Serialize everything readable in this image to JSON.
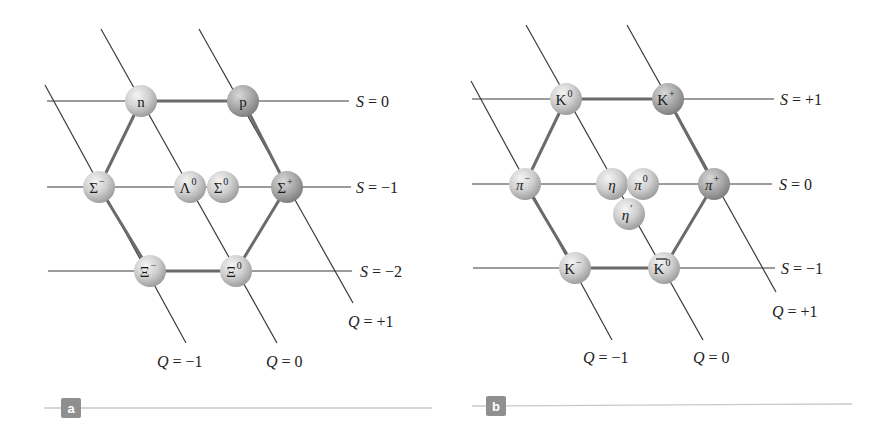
{
  "figure": {
    "colors": {
      "line": "#3a3a3a",
      "hex_edge": "#6b6b6b",
      "ball_light": "#f2f2f2",
      "ball_dark": "#9a9a9a",
      "ball_dark_charged": "#8a8a8a",
      "caption_line": "#c9c9c9",
      "badge": "#8f8f8f"
    },
    "panels": [
      {
        "id": "a",
        "badge": "a",
        "title": "Baryon octet",
        "badge_pos": [
          71,
          408
        ],
        "caption_line": [
          44,
          408,
          432,
          408
        ],
        "s_lines": [
          {
            "label_var": "S",
            "label_val": "= 0",
            "y": 101,
            "x1": 47,
            "x2": 349,
            "label_x": 356
          },
          {
            "label_var": "S",
            "label_val": "= −1",
            "y": 187,
            "x1": 47,
            "x2": 351,
            "label_x": 356
          },
          {
            "label_var": "S",
            "label_val": "= −2",
            "y": 271,
            "x1": 48,
            "x2": 352,
            "label_x": 360
          }
        ],
        "q_lines": [
          {
            "label_var": "Q",
            "label_val": "= −1",
            "x1": 45,
            "y1": 85,
            "x2": 186,
            "y2": 343,
            "label_x": 157,
            "label_y": 367
          },
          {
            "label_var": "Q",
            "label_val": "= 0",
            "x1": 101,
            "y1": 29,
            "x2": 277,
            "y2": 343,
            "label_x": 266,
            "label_y": 367
          },
          {
            "label_var": "Q",
            "label_val": "= +1",
            "x1": 199,
            "y1": 29,
            "x2": 353,
            "y2": 303,
            "label_x": 348,
            "label_y": 327
          }
        ],
        "hexagon": [
          [
            141,
            101
          ],
          [
            243,
            101
          ],
          [
            287,
            187
          ],
          [
            236,
            271
          ],
          [
            150,
            271
          ],
          [
            99,
            187
          ]
        ],
        "particles": [
          {
            "name": "neutron",
            "symbol": "n",
            "sup": "",
            "x": 141,
            "y": 101,
            "charged": false
          },
          {
            "name": "proton",
            "symbol": "p",
            "sup": "",
            "x": 243,
            "y": 101,
            "charged": true
          },
          {
            "name": "sigma-minus",
            "symbol": "Σ",
            "sup": "−",
            "x": 99,
            "y": 187,
            "charged": false
          },
          {
            "name": "lambda-zero",
            "symbol": "Λ",
            "sup": "0",
            "x": 190,
            "y": 187,
            "charged": false
          },
          {
            "name": "sigma-zero",
            "symbol": "Σ",
            "sup": "0",
            "x": 223,
            "y": 187,
            "charged": false
          },
          {
            "name": "sigma-plus",
            "symbol": "Σ",
            "sup": "+",
            "x": 287,
            "y": 187,
            "charged": true
          },
          {
            "name": "xi-minus",
            "symbol": "Ξ",
            "sup": "−",
            "x": 150,
            "y": 271,
            "charged": false
          },
          {
            "name": "xi-zero",
            "symbol": "Ξ",
            "sup": "0",
            "x": 236,
            "y": 271,
            "charged": false
          }
        ]
      },
      {
        "id": "b",
        "badge": "b",
        "title": "Meson nonet",
        "badge_pos": [
          496,
          406
        ],
        "caption_line": [
          472,
          406,
          852,
          404
        ],
        "s_lines": [
          {
            "label_var": "S",
            "label_val": "= +1",
            "y": 99,
            "x1": 472,
            "x2": 774,
            "label_x": 780
          },
          {
            "label_var": "S",
            "label_val": "= 0",
            "y": 184,
            "x1": 472,
            "x2": 772,
            "label_x": 779
          },
          {
            "label_var": "S",
            "label_val": "= −1",
            "y": 268,
            "x1": 473,
            "x2": 775,
            "label_x": 781
          }
        ],
        "q_lines": [
          {
            "label_var": "Q",
            "label_val": "= −1",
            "x1": 471,
            "y1": 81,
            "x2": 612,
            "y2": 340,
            "label_x": 583,
            "label_y": 363
          },
          {
            "label_var": "Q",
            "label_val": "= 0",
            "x1": 526,
            "y1": 25,
            "x2": 703,
            "y2": 340,
            "label_x": 693,
            "label_y": 363
          },
          {
            "label_var": "Q",
            "label_val": "= +1",
            "x1": 627,
            "y1": 25,
            "x2": 776,
            "y2": 292,
            "label_x": 772,
            "label_y": 317
          }
        ],
        "hexagon": [
          [
            566,
            99
          ],
          [
            668,
            99
          ],
          [
            714,
            184
          ],
          [
            664,
            268
          ],
          [
            575,
            268
          ],
          [
            525,
            184
          ]
        ],
        "particles": [
          {
            "name": "kaon-zero",
            "symbol": "K",
            "sup": "0",
            "x": 566,
            "y": 99,
            "charged": false,
            "bar": false
          },
          {
            "name": "kaon-plus",
            "symbol": "K",
            "sup": "+",
            "x": 668,
            "y": 99,
            "charged": true,
            "bar": false
          },
          {
            "name": "pion-minus",
            "symbol": "π",
            "sup": "−",
            "x": 525,
            "y": 184,
            "charged": false,
            "italic": true,
            "bar": false
          },
          {
            "name": "eta",
            "symbol": "η",
            "sup": "",
            "x": 612,
            "y": 184,
            "charged": false,
            "italic": true,
            "bar": false
          },
          {
            "name": "pion-zero",
            "symbol": "π",
            "sup": "0",
            "x": 643,
            "y": 184,
            "charged": false,
            "italic": true,
            "bar": false
          },
          {
            "name": "pion-plus",
            "symbol": "π",
            "sup": "+",
            "x": 714,
            "y": 184,
            "charged": true,
            "italic": true,
            "bar": false
          },
          {
            "name": "eta-prime",
            "symbol": "η",
            "sup": "′",
            "x": 629,
            "y": 214,
            "charged": false,
            "italic": true,
            "bar": false
          },
          {
            "name": "kaon-minus",
            "symbol": "K",
            "sup": "−",
            "x": 575,
            "y": 268,
            "charged": false,
            "bar": false
          },
          {
            "name": "anti-kaon-zero",
            "symbol": "K",
            "sup": "0",
            "x": 664,
            "y": 268,
            "charged": false,
            "bar": true
          }
        ]
      }
    ]
  }
}
